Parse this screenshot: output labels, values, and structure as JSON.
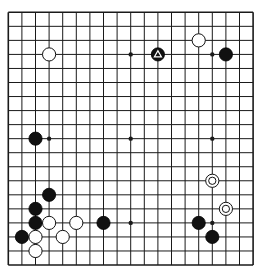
{
  "board": {
    "size": 19,
    "origin_x": 8.3,
    "origin_y": 12.3,
    "step_x": 13.6,
    "step_y": 14.04,
    "stone_radius": 6.6,
    "line_color": "#1a1a1a",
    "background": "#ffffff",
    "star_points": [
      [
        3,
        3
      ],
      [
        9,
        3
      ],
      [
        15,
        3
      ],
      [
        3,
        9
      ],
      [
        9,
        9
      ],
      [
        15,
        9
      ],
      [
        3,
        15
      ],
      [
        9,
        15
      ],
      [
        15,
        15
      ]
    ]
  },
  "stones": [
    {
      "color": "black",
      "x": 11,
      "y": 3,
      "marker": "triangle"
    },
    {
      "color": "black",
      "x": 16,
      "y": 3
    },
    {
      "color": "black",
      "x": 2,
      "y": 9
    },
    {
      "color": "black",
      "x": 3,
      "y": 13
    },
    {
      "color": "black",
      "x": 2,
      "y": 14
    },
    {
      "color": "black",
      "x": 2,
      "y": 15
    },
    {
      "color": "black",
      "x": 1,
      "y": 16
    },
    {
      "color": "black",
      "x": 7,
      "y": 15
    },
    {
      "color": "black",
      "x": 14,
      "y": 15
    },
    {
      "color": "black",
      "x": 15,
      "y": 16
    },
    {
      "color": "white",
      "x": 3,
      "y": 3
    },
    {
      "color": "white",
      "x": 14,
      "y": 2
    },
    {
      "color": "white",
      "x": 3,
      "y": 15
    },
    {
      "color": "white",
      "x": 5,
      "y": 15
    },
    {
      "color": "white",
      "x": 2,
      "y": 16
    },
    {
      "color": "white",
      "x": 4,
      "y": 16
    },
    {
      "color": "white",
      "x": 2,
      "y": 17
    },
    {
      "color": "white",
      "x": 15,
      "y": 12,
      "marker": "circle"
    },
    {
      "color": "white",
      "x": 16,
      "y": 14,
      "marker": "circle"
    }
  ]
}
